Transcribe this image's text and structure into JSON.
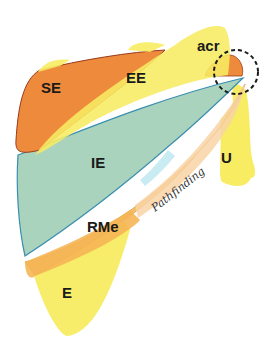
{
  "diagram": {
    "type": "anatomical-schematic",
    "regions": [
      {
        "id": "SE",
        "label": "SE",
        "color": "#ee8a3c"
      },
      {
        "id": "EE",
        "label": "EE",
        "color": "#f7ea57"
      },
      {
        "id": "acr",
        "label": "acr",
        "color": "#f7ea57"
      },
      {
        "id": "IE",
        "label": "IE",
        "color": "#a9d3bd"
      },
      {
        "id": "U",
        "label": "U",
        "color": "#f7ea57"
      },
      {
        "id": "RMe",
        "label": "RMe",
        "color": "#f5c06a"
      },
      {
        "id": "E",
        "label": "E",
        "color": "#f7ea57"
      }
    ],
    "highlight": {
      "shape": "dashed-circle",
      "target": "acr-tip",
      "color": "#1a1a1a"
    },
    "signature": "Pathfinding"
  }
}
